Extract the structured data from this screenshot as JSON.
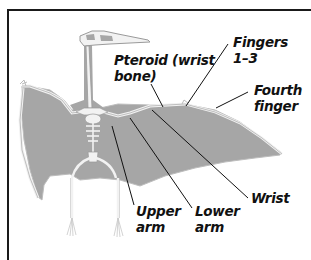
{
  "diagram": {
    "colors": {
      "membrane": "#a6a6a6",
      "bone": "#f2f2f2",
      "bone_outline": "#9a9a9a",
      "leader_line": "#111111",
      "frame": "#1a1a1a"
    },
    "labels": {
      "pteroid_line1": "Pteroid (wrist",
      "pteroid_line2": "bone)",
      "fingers_line1": "Fingers",
      "fingers_line2": "1–3",
      "fourth_line1": "Fourth",
      "fourth_line2": "finger",
      "wrist": "Wrist",
      "upper_line1": "Upper",
      "upper_line2": "arm",
      "lower_line1": "Lower",
      "lower_line2": "arm"
    }
  }
}
